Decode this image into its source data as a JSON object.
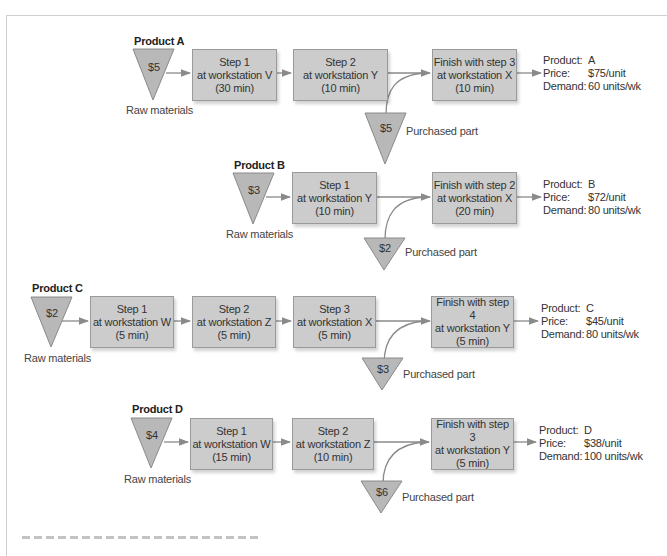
{
  "products": [
    {
      "id": "A",
      "title": "Product A",
      "raw_material_cost": "$5",
      "raw_material_label": "Raw materials",
      "steps": [
        {
          "line1": "Step 1",
          "line2": "at workstation V",
          "line3": "(30 min)"
        },
        {
          "line1": "Step 2",
          "line2": "at workstation Y",
          "line3": "(10 min)"
        },
        {
          "line1": "Finish with step 3",
          "line2": "at workstation X",
          "line3": "(10 min)"
        }
      ],
      "purchased_part_cost": "$5",
      "purchased_part_label": "Purchased part",
      "info": {
        "product_key": "Product:",
        "product": "A",
        "price_key": "Price:",
        "price": "$75/unit",
        "demand_key": "Demand:",
        "demand": "60 units/wk"
      }
    },
    {
      "id": "B",
      "title": "Product B",
      "raw_material_cost": "$3",
      "raw_material_label": "Raw materials",
      "steps": [
        {
          "line1": "Step 1",
          "line2": "at workstation Y",
          "line3": "(10 min)"
        },
        {
          "line1": "Finish with step 2",
          "line2": "at workstation X",
          "line3": "(20 min)"
        }
      ],
      "purchased_part_cost": "$2",
      "purchased_part_label": "Purchased part",
      "info": {
        "product_key": "Product:",
        "product": "B",
        "price_key": "Price:",
        "price": "$72/unit",
        "demand_key": "Demand:",
        "demand": "80 units/wk"
      }
    },
    {
      "id": "C",
      "title": "Product C",
      "raw_material_cost": "$2",
      "raw_material_label": "Raw materials",
      "steps": [
        {
          "line1": "Step 1",
          "line2": "at workstation W",
          "line3": "(5 min)"
        },
        {
          "line1": "Step 2",
          "line2": "at workstation Z",
          "line3": "(5 min)"
        },
        {
          "line1": "Step 3",
          "line2": "at workstation X",
          "line3": "(5 min)"
        },
        {
          "line1": "Finish with step 4",
          "line2": "at workstation Y",
          "line3": "(5 min)"
        }
      ],
      "purchased_part_cost": "$3",
      "purchased_part_label": "Purchased part",
      "info": {
        "product_key": "Product:",
        "product": "C",
        "price_key": "Price:",
        "price": "$45/unit",
        "demand_key": "Demand:",
        "demand": "80 units/wk"
      }
    },
    {
      "id": "D",
      "title": "Product D",
      "raw_material_cost": "$4",
      "raw_material_label": "Raw materials",
      "steps": [
        {
          "line1": "Step 1",
          "line2": "at workstation W",
          "line3": "(15 min)"
        },
        {
          "line1": "Step 2",
          "line2": "at workstation Z",
          "line3": "(10 min)"
        },
        {
          "line1": "Finish with step 3",
          "line2": "at workstation Y",
          "line3": "(5 min)"
        }
      ],
      "purchased_part_cost": "$6",
      "purchased_part_label": "Purchased part",
      "info": {
        "product_key": "Product:",
        "product": "D",
        "price_key": "Price:",
        "price": "$38/unit",
        "demand_key": "Demand:",
        "demand": "100 units/wk"
      }
    }
  ],
  "colors": {
    "box_fill": "#cccccc",
    "box_border": "#9a9a9a",
    "triangle_fill": "#b8b8b8",
    "arrow": "#8a8a8a"
  }
}
